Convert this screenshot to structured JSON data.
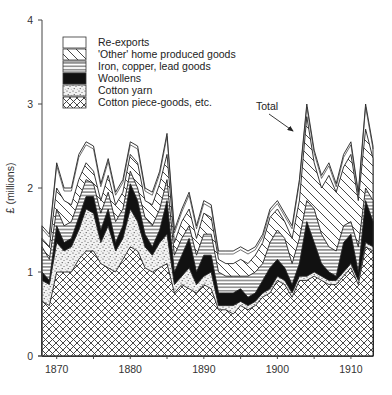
{
  "chart_data": {
    "type": "area",
    "stacked": true,
    "title": "",
    "xlabel": "",
    "ylabel": "£ (millions)",
    "xlim": [
      1868,
      1913
    ],
    "ylim": [
      0,
      4
    ],
    "yticks": [
      0,
      1,
      2,
      3,
      4
    ],
    "xticks": [
      1870,
      1880,
      1890,
      1900,
      1910
    ],
    "grid": false,
    "legend_position": "top-left inside",
    "annotations": [
      {
        "text": "Total",
        "target_year": 1904,
        "target_value": 3.0
      }
    ],
    "x": [
      1868,
      1869,
      1870,
      1871,
      1872,
      1873,
      1874,
      1875,
      1876,
      1877,
      1878,
      1879,
      1880,
      1881,
      1882,
      1883,
      1884,
      1885,
      1886,
      1887,
      1888,
      1889,
      1890,
      1891,
      1892,
      1893,
      1894,
      1895,
      1896,
      1897,
      1898,
      1899,
      1900,
      1901,
      1902,
      1903,
      1904,
      1905,
      1906,
      1907,
      1908,
      1909,
      1910,
      1911,
      1912,
      1913
    ],
    "cumulative_series": [
      {
        "name": "Cotton piece-goods, etc.",
        "pattern": "crosshatch",
        "values": [
          0.65,
          0.6,
          1.0,
          1.0,
          1.0,
          1.15,
          1.25,
          1.25,
          1.1,
          1.05,
          1.0,
          1.15,
          1.3,
          1.25,
          1.05,
          1.0,
          1.05,
          1.1,
          0.75,
          0.85,
          0.8,
          0.75,
          0.85,
          0.8,
          0.55,
          0.55,
          0.5,
          0.6,
          0.55,
          0.6,
          0.7,
          0.75,
          0.9,
          0.85,
          0.7,
          0.9,
          0.9,
          0.95,
          0.9,
          0.85,
          0.85,
          0.95,
          1.05,
          0.85,
          1.3,
          1.25
        ]
      },
      {
        "name": "Cotton yarn",
        "pattern": "stipple",
        "values": [
          0.9,
          0.85,
          1.35,
          1.25,
          1.3,
          1.5,
          1.75,
          1.7,
          1.35,
          1.55,
          1.25,
          1.4,
          1.75,
          1.6,
          1.3,
          1.2,
          1.35,
          1.45,
          0.85,
          0.95,
          1.05,
          0.85,
          0.95,
          1.0,
          0.6,
          0.6,
          0.6,
          0.65,
          0.6,
          0.65,
          0.75,
          0.8,
          0.95,
          0.9,
          0.75,
          0.95,
          0.95,
          1.0,
          0.95,
          0.9,
          0.9,
          1.0,
          1.1,
          0.9,
          1.35,
          1.3
        ]
      },
      {
        "name": "Woollens",
        "pattern": "solid-black",
        "values": [
          1.0,
          0.9,
          1.55,
          1.35,
          1.4,
          1.65,
          1.9,
          1.9,
          1.5,
          1.75,
          1.35,
          1.55,
          2.05,
          1.85,
          1.45,
          1.3,
          1.5,
          1.85,
          1.0,
          1.2,
          1.4,
          1.0,
          1.2,
          1.2,
          0.75,
          0.75,
          0.75,
          0.8,
          0.7,
          0.75,
          0.9,
          1.05,
          1.15,
          1.05,
          0.85,
          1.1,
          1.6,
          1.35,
          1.1,
          1.0,
          0.95,
          1.35,
          1.45,
          1.0,
          1.85,
          1.6
        ]
      },
      {
        "name": "Iron, copper, lead goods",
        "pattern": "horizontal-lines",
        "values": [
          1.3,
          1.15,
          1.75,
          1.55,
          1.6,
          1.85,
          2.1,
          2.05,
          1.7,
          1.95,
          1.6,
          1.75,
          2.2,
          2.0,
          1.65,
          1.55,
          1.75,
          2.1,
          1.2,
          1.4,
          1.55,
          1.2,
          1.45,
          1.45,
          1.0,
          0.95,
          0.95,
          0.95,
          0.95,
          1.0,
          1.1,
          1.35,
          1.5,
          1.4,
          1.1,
          1.4,
          1.85,
          1.75,
          1.45,
          1.3,
          1.25,
          1.55,
          1.6,
          1.3,
          2.0,
          1.85
        ]
      },
      {
        "name": "'Other' home produced goods",
        "pattern": "diagonal-lines",
        "values": [
          1.4,
          1.3,
          2.0,
          1.85,
          1.8,
          2.1,
          2.3,
          2.2,
          1.85,
          2.15,
          1.8,
          1.95,
          2.4,
          2.3,
          1.85,
          1.8,
          2.05,
          2.4,
          1.35,
          1.6,
          1.75,
          1.4,
          1.7,
          1.65,
          1.15,
          1.1,
          1.1,
          1.15,
          1.1,
          1.2,
          1.35,
          1.65,
          1.75,
          1.6,
          1.4,
          1.85,
          2.85,
          2.3,
          2.0,
          2.15,
          1.95,
          2.25,
          2.4,
          1.85,
          2.7,
          2.35
        ]
      },
      {
        "name": "Re-exports",
        "pattern": "blank",
        "values": [
          1.55,
          1.45,
          2.3,
          2.0,
          2.0,
          2.4,
          2.55,
          2.5,
          2.05,
          2.35,
          1.95,
          2.1,
          2.55,
          2.5,
          2.0,
          1.95,
          2.2,
          2.65,
          1.5,
          1.75,
          1.95,
          1.55,
          1.85,
          1.8,
          1.25,
          1.25,
          1.25,
          1.3,
          1.25,
          1.3,
          1.45,
          1.75,
          1.85,
          1.7,
          1.55,
          2.1,
          3.0,
          2.45,
          2.15,
          2.3,
          2.05,
          2.4,
          2.55,
          1.95,
          3.0,
          2.5
        ]
      }
    ]
  },
  "axis": {
    "ylabel": "£ (millions)",
    "yticks": [
      "0",
      "1",
      "2",
      "3",
      "4"
    ],
    "xticks": [
      "1870",
      "1880",
      "1890",
      "1900",
      "1910"
    ]
  },
  "legend": {
    "items": [
      {
        "label": "Re-exports",
        "pattern": "blank"
      },
      {
        "label": "'Other' home produced goods",
        "pattern": "diagonal-lines"
      },
      {
        "label": "Iron, copper, lead goods",
        "pattern": "horizontal-lines"
      },
      {
        "label": "Woollens",
        "pattern": "solid-black"
      },
      {
        "label": "Cotton yarn",
        "pattern": "stipple"
      },
      {
        "label": "Cotton piece-goods, etc.",
        "pattern": "crosshatch"
      }
    ]
  },
  "annotation": {
    "label": "Total"
  },
  "colors": {
    "ink": "#222222",
    "background": "#ffffff"
  }
}
